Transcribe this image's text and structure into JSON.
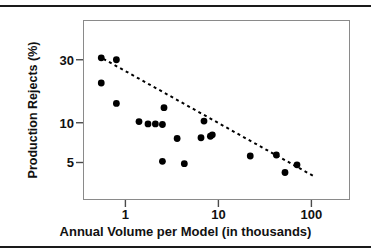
{
  "chart_data": {
    "type": "scatter",
    "title": "",
    "xlabel": "Annual Volume per Model (in thousands)",
    "ylabel": "Production Rejects (%)",
    "xscale": "log",
    "yscale": "log",
    "xlim": [
      0.35,
      260
    ],
    "ylim": [
      2.6,
      60
    ],
    "xticks": [
      1,
      10,
      100
    ],
    "xtick_labels": [
      "1",
      "10",
      "100"
    ],
    "yticks": [
      5,
      10,
      30
    ],
    "ytick_labels": [
      "5",
      "10",
      "30"
    ],
    "grid": false,
    "legend": false,
    "marker": "filled-circle",
    "marker_color": "#000000",
    "points": [
      {
        "x": 0.55,
        "y": 31
      },
      {
        "x": 0.55,
        "y": 20
      },
      {
        "x": 0.8,
        "y": 30
      },
      {
        "x": 0.8,
        "y": 14
      },
      {
        "x": 1.4,
        "y": 10.2
      },
      {
        "x": 1.75,
        "y": 9.8
      },
      {
        "x": 2.1,
        "y": 9.8
      },
      {
        "x": 2.5,
        "y": 9.7
      },
      {
        "x": 2.5,
        "y": 5.1
      },
      {
        "x": 2.6,
        "y": 13
      },
      {
        "x": 3.6,
        "y": 7.6
      },
      {
        "x": 4.3,
        "y": 4.9
      },
      {
        "x": 6.5,
        "y": 7.7
      },
      {
        "x": 7.0,
        "y": 10.3
      },
      {
        "x": 8.2,
        "y": 7.9
      },
      {
        "x": 8.6,
        "y": 8.1
      },
      {
        "x": 22,
        "y": 5.6
      },
      {
        "x": 42,
        "y": 5.7
      },
      {
        "x": 52,
        "y": 4.2
      },
      {
        "x": 70,
        "y": 4.8
      }
    ],
    "trendline": {
      "style": "dashed",
      "color": "#000000",
      "x_start": 0.58,
      "y_start": 30.5,
      "x_end": 105,
      "y_end": 3.95
    },
    "annotations": []
  },
  "figure": {
    "rule_top_label": "top-divider",
    "rule_bottom_label": "bottom-divider",
    "frame_color": "#8a8a8a",
    "background": "#ffffff"
  }
}
